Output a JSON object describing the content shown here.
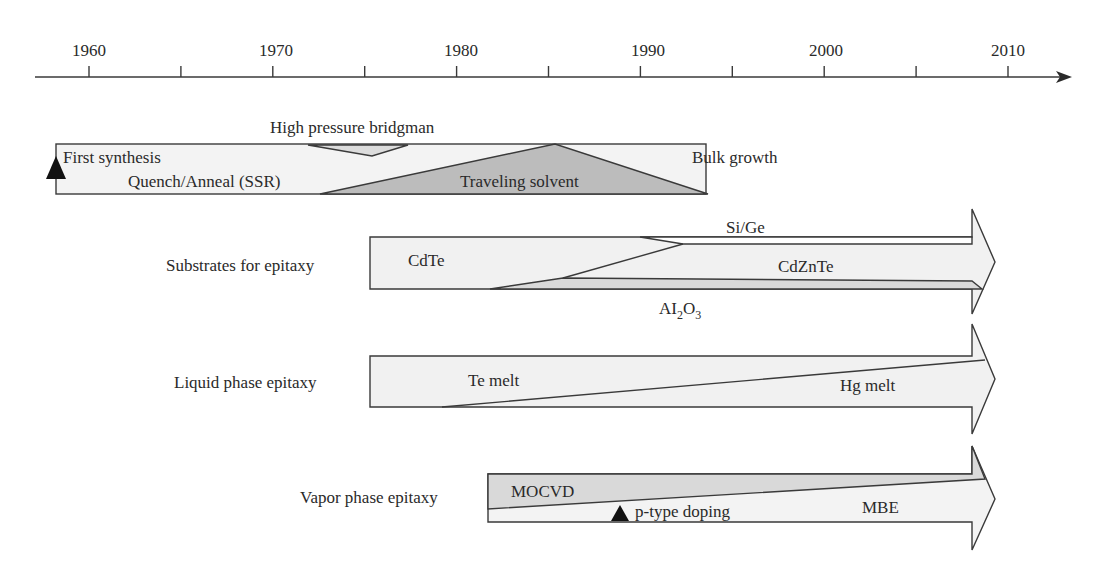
{
  "diagram": {
    "type": "timeline",
    "axis": {
      "start_year": 1957.5,
      "end_year": 2013.5,
      "major_ticks": [
        1960,
        1970,
        1980,
        1990,
        2000,
        2010
      ],
      "minor_ticks": [
        1965,
        1975,
        1985,
        1995,
        2005
      ],
      "tick_labels": [
        "1960",
        "1970",
        "1980",
        "1990",
        "2000",
        "2010"
      ]
    },
    "rows": [
      {
        "id": "bulk",
        "label": "Bulk growth",
        "start_year": 1958,
        "end_year": 1993.5,
        "regions": [
          {
            "name": "Quench/Anneal (SSR)",
            "shade": "light"
          },
          {
            "name": "High pressure bridgman",
            "shade": "mid"
          },
          {
            "name": "Traveling solvent",
            "shade": "dark"
          }
        ],
        "milestones": [
          {
            "label": "First synthesis",
            "year": 1958
          }
        ]
      },
      {
        "id": "substrates",
        "label": "Substrates for epitaxy",
        "start_year": 1975,
        "end_year": 2010,
        "regions": [
          {
            "name": "CdTe",
            "shade": "light"
          },
          {
            "name": "Si/Ge",
            "shade": "white"
          },
          {
            "name": "CdZnTe",
            "shade": "light"
          },
          {
            "name": "Al2O3",
            "shade": "mid",
            "display": [
              "AI",
              "2",
              "O",
              "3"
            ]
          }
        ]
      },
      {
        "id": "lpe",
        "label": "Liquid phase epitaxy",
        "start_year": 1975,
        "end_year": 2010,
        "regions": [
          {
            "name": "Te melt",
            "shade": "light"
          },
          {
            "name": "Hg melt",
            "shade": "light"
          }
        ]
      },
      {
        "id": "vpe",
        "label": "Vapor phase epitaxy",
        "start_year": 1981.5,
        "end_year": 2010,
        "regions": [
          {
            "name": "MOCVD",
            "shade": "mid"
          },
          {
            "name": "MBE",
            "shade": "light"
          }
        ],
        "milestones": [
          {
            "label": "p-type doping",
            "year": 1988.5
          }
        ]
      }
    ],
    "colors": {
      "white": "#ffffff",
      "light": "#f1f1f1",
      "mid": "#d9d9d9",
      "dark": "#b9b9b9",
      "stroke": "#3a3a3a",
      "marker": "#111111"
    }
  }
}
